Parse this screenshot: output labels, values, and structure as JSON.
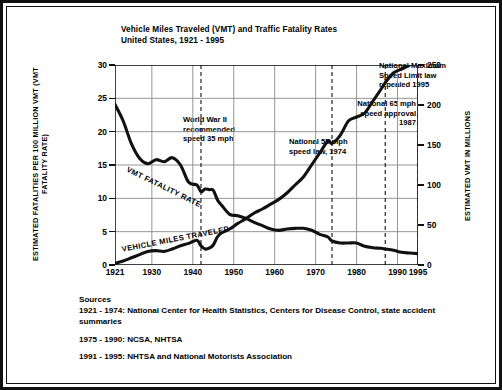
{
  "title": {
    "line1": "Vehicle Miles Traveled (VMT) and Traffic Fatality Rates",
    "line2": "United States, 1921 - 1995"
  },
  "axes": {
    "left_label": "ESTIMATED FATALITIES PER 100 MILLION VMT (VMT FATALITY RATE)",
    "right_label": "ESTIMATED VMT IN MILLIONS",
    "left_ticks": [
      "0",
      "5",
      "10",
      "15",
      "20",
      "25",
      "30"
    ],
    "right_ticks": [
      "0",
      "50",
      "100",
      "150",
      "200",
      "250"
    ],
    "x_ticks": [
      "1921",
      "1930",
      "1940",
      "1950",
      "1960",
      "1970",
      "1980",
      "1990",
      "1995"
    ]
  },
  "series_labels": {
    "fatality": "VMT FATALITY RATE",
    "vmt": "VEHICLE MILES TRAVELED"
  },
  "annotations": [
    {
      "id": "wwii",
      "text": "World War II\nrecommended\nspeed 35 mph",
      "year": 1942
    },
    {
      "id": "law55",
      "text": "National 55 mph\nspeed law, 1974",
      "year": 1974
    },
    {
      "id": "mph65",
      "text": "National 65 mph\nspeed approval\n1987",
      "year": 1987
    },
    {
      "id": "repeal",
      "text": "National Maximum\nSpeed Limit law\nrepealed 1995",
      "year": 1995
    }
  ],
  "sources": {
    "heading": "Sources",
    "entry1": "1921 - 1974: National Center for Health Statistics, Centers for Disease Control, state accident summaries",
    "entry2": "1975 - 1990: NCSA, NHTSA",
    "entry3": "1991 - 1995: NHTSA and National Motorists Association"
  },
  "colors": {
    "ink": "#111111",
    "grid": "#8a8a8a",
    "background": "#ffffff"
  },
  "chart_data": {
    "type": "line",
    "xlabel": "",
    "ylabel": "ESTIMATED FATALITIES PER 100 MILLION VMT (VMT FATALITY RATE)",
    "y2label": "ESTIMATED VMT IN MILLIONS",
    "xlim": [
      1921,
      1995
    ],
    "ylim": [
      0,
      30
    ],
    "y2lim": [
      0,
      250
    ],
    "grid": true,
    "legend": "inline-labels",
    "x": [
      1921,
      1923,
      1925,
      1927,
      1929,
      1931,
      1933,
      1935,
      1937,
      1939,
      1941,
      1942,
      1943,
      1944,
      1945,
      1946,
      1947,
      1949,
      1951,
      1953,
      1955,
      1957,
      1959,
      1961,
      1963,
      1965,
      1967,
      1969,
      1971,
      1973,
      1974,
      1976,
      1978,
      1980,
      1982,
      1984,
      1986,
      1987,
      1989,
      1991,
      1993,
      1995
    ],
    "series": [
      {
        "name": "VMT FATALITY RATE",
        "axis": "left",
        "units": "fatalities per 100 million VMT",
        "values": [
          24.1,
          21.6,
          18.2,
          16.0,
          15.2,
          15.8,
          15.5,
          16.1,
          15.0,
          12.4,
          12.0,
          11.0,
          11.4,
          11.3,
          11.2,
          9.8,
          9.0,
          7.6,
          7.4,
          7.0,
          6.4,
          5.9,
          5.4,
          5.2,
          5.4,
          5.5,
          5.5,
          5.2,
          4.6,
          4.2,
          3.6,
          3.3,
          3.3,
          3.3,
          2.8,
          2.6,
          2.5,
          2.4,
          2.2,
          1.9,
          1.8,
          1.7
        ]
      },
      {
        "name": "VEHICLE MILES TRAVELED",
        "axis": "right",
        "units": "billions of vehicle miles (scale shown in millions)",
        "values": [
          2,
          5,
          9,
          13,
          17,
          18,
          17,
          20,
          24,
          27,
          31,
          24,
          20,
          21,
          25,
          35,
          40,
          45,
          52,
          58,
          65,
          70,
          76,
          82,
          90,
          100,
          110,
          125,
          140,
          155,
          152,
          162,
          180,
          185,
          190,
          205,
          220,
          228,
          240,
          245,
          250,
          258
        ]
      }
    ],
    "annotations": [
      {
        "label": "World War II recommended speed 35 mph",
        "x": 1942
      },
      {
        "label": "National 55 mph speed law, 1974",
        "x": 1974
      },
      {
        "label": "National 65 mph speed approval 1987",
        "x": 1987
      },
      {
        "label": "National Maximum Speed Limit law repealed 1995",
        "x": 1995
      }
    ]
  }
}
